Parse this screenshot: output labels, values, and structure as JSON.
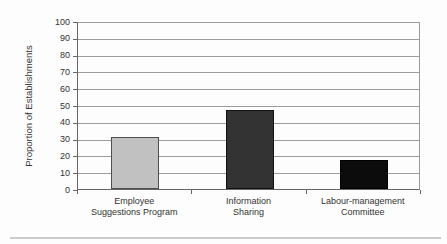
{
  "chart_data": {
    "type": "bar",
    "title": "",
    "xlabel": "",
    "ylabel": "Proportion of Establishments",
    "categories": [
      "Employee Suggestions Program",
      "Information Sharing",
      "Labour-management Committee"
    ],
    "category_label_lines": [
      [
        "Employee",
        "Suggestions Program"
      ],
      [
        "Information",
        "Sharing"
      ],
      [
        "Labour-management",
        "Committee"
      ]
    ],
    "values": [
      31,
      47,
      17
    ],
    "bar_fill_colors": [
      "#c1c1c1",
      "#333333",
      "#0c0c0c"
    ],
    "bar_border_colors": [
      "#4f4f4f",
      "#111111",
      "#000000"
    ],
    "ylim": [
      0,
      100
    ],
    "yticks": [
      0,
      10,
      20,
      30,
      40,
      50,
      60,
      70,
      80,
      90,
      100
    ],
    "grid": "horizontal",
    "legend": "none",
    "colors": {
      "gridline": "#9c9c9c",
      "axis": "#666666",
      "text": "#333333",
      "divider": "#cbcbcb",
      "background": "#fdfdfd"
    }
  }
}
